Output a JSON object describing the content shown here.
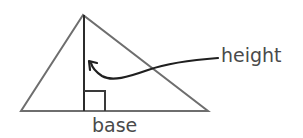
{
  "diagram": {
    "labels": {
      "height": "height",
      "base": "base"
    },
    "colors": {
      "triangle_stroke": "#6e6e6e",
      "height_line": "#2b2b2b",
      "arrow": "#1f1f1f",
      "text": "#4a4a4a"
    },
    "shapes": {
      "triangle": {
        "apex": [
          83,
          15
        ],
        "left": [
          21,
          111
        ],
        "right": [
          208,
          111
        ]
      },
      "altitude": {
        "from": [
          84,
          15
        ],
        "to": [
          84,
          111
        ]
      },
      "right_angle_marker": {
        "x": 84,
        "y": 91,
        "w": 21,
        "h": 20
      },
      "arrow": {
        "start": [
          218,
          58
        ],
        "tip": [
          90,
          62
        ]
      }
    }
  }
}
